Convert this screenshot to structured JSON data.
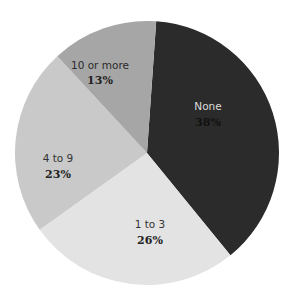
{
  "chart_data": {
    "type": "pie",
    "title": "",
    "categories": [
      "None",
      "1 to 3",
      "4 to 9",
      "10 or more"
    ],
    "values": [
      38,
      26,
      23,
      13
    ],
    "value_labels": [
      "38%",
      "26%",
      "23%",
      "13%"
    ],
    "colors": [
      "#2b2b2b",
      "#e3e3e3",
      "#c9c9c9",
      "#a6a6a6"
    ],
    "label_colors": [
      "#dcdcdc",
      "#333333",
      "#333333",
      "#222222"
    ],
    "pct_colors": [
      "#111111",
      "#222222",
      "#222222",
      "#222222"
    ],
    "start_angle_deg": 4,
    "direction": "clockwise",
    "legend": "none",
    "labels_inside": true
  },
  "slices": [
    {
      "label": "None",
      "pct": "38%"
    },
    {
      "label": "1 to 3",
      "pct": "26%"
    },
    {
      "label": "4 to 9",
      "pct": "23%"
    },
    {
      "label": "10 or more",
      "pct": "13%"
    }
  ]
}
